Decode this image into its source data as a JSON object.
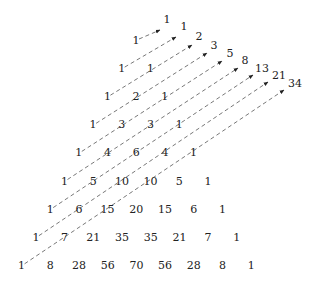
{
  "pascal_rows": [
    [
      1
    ],
    [
      1,
      1
    ],
    [
      1,
      2,
      1
    ],
    [
      1,
      3,
      3,
      1
    ],
    [
      1,
      4,
      6,
      4,
      1
    ],
    [
      1,
      5,
      10,
      10,
      5,
      1
    ],
    [
      1,
      6,
      15,
      20,
      15,
      6,
      1
    ],
    [
      1,
      7,
      21,
      35,
      35,
      21,
      7,
      1
    ],
    [
      1,
      8,
      28,
      56,
      70,
      56,
      28,
      8,
      1
    ]
  ],
  "fibonacci": [
    1,
    1,
    2,
    3,
    5,
    8,
    13,
    21,
    34
  ],
  "colors": {
    "text": "#222222",
    "line": "#555555",
    "background": "#ffffff"
  },
  "icons": {
    "arrowhead": "arrowhead-icon"
  }
}
